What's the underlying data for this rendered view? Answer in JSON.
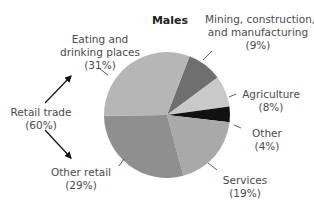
{
  "chart_data": {
    "type": "pie",
    "title": "Males",
    "categories": [
      "Mining, construction, and manufacturing",
      "Agriculture",
      "Other",
      "Services",
      "Other retail",
      "Eating and drinking places"
    ],
    "values": [
      9,
      8,
      4,
      19,
      29,
      31
    ],
    "unit": "%",
    "colors": [
      "#6f6f6f",
      "#c9c9c9",
      "#111111",
      "#a9a9a9",
      "#8f8f8f",
      "#b6b6b6"
    ],
    "start_angle_deg": 21,
    "direction": "clockwise",
    "annotations": [
      {
        "text": "Retail trade",
        "value": "(60%)",
        "note": "arrows point to Eating and drinking places and Other retail"
      }
    ]
  },
  "labels": {
    "title": "Males",
    "eating_1": "Eating and",
    "eating_2": "drinking places",
    "eating_3": "(31%)",
    "mining_1": "Mining, construction,",
    "mining_2": "and manufacturing",
    "mining_3": "(9%)",
    "agri_1": "Agriculture",
    "agri_2": "(8%)",
    "other_1": "Other",
    "other_2": "(4%)",
    "services_1": "Services",
    "services_2": "(19%)",
    "otherretail_1": "Other retail",
    "otherretail_2": "(29%)",
    "retail_1": "Retail trade",
    "retail_2": "(60%)"
  }
}
